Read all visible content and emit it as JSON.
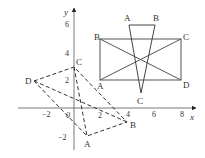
{
  "axes": {
    "x_label": "x",
    "y_label": "y",
    "origin_label": "0",
    "x_ticks": [
      {
        "value": -2,
        "label": "−2"
      },
      {
        "value": 2,
        "label": "2"
      },
      {
        "value": 4,
        "label": "4"
      },
      {
        "value": 6,
        "label": "6"
      },
      {
        "value": 8,
        "label": "8"
      }
    ],
    "y_ticks": [
      {
        "value": 6,
        "label": "6"
      },
      {
        "value": 4,
        "label": "4"
      },
      {
        "value": 2,
        "label": "2"
      },
      {
        "value": -2,
        "label": "−2"
      }
    ]
  },
  "left_quadrilateral": {
    "style": "dashed",
    "vertices": [
      {
        "label": "D",
        "x": -3,
        "y": 2
      },
      {
        "label": "C",
        "x": 0,
        "y": 3
      },
      {
        "label": "B",
        "x": 4,
        "y": -1
      },
      {
        "label": "A",
        "x": 1,
        "y": -2
      }
    ],
    "diagonals": [
      [
        "D",
        "B"
      ],
      [
        "C",
        "A"
      ]
    ]
  },
  "rectangle": {
    "style": "solid",
    "vertices": [
      {
        "label": "B",
        "x": 2,
        "y": 5
      },
      {
        "label": "C",
        "x": 8,
        "y": 5
      },
      {
        "label": "D",
        "x": 8,
        "y": 2
      },
      {
        "label": "A",
        "x": 2,
        "y": 2
      }
    ],
    "diagonals": [
      [
        "B",
        "D"
      ],
      [
        "A",
        "C"
      ]
    ]
  },
  "triangle": {
    "style": "solid",
    "vertices": [
      {
        "label": "A",
        "x": 4,
        "y": 6
      },
      {
        "label": "B",
        "x": 6,
        "y": 6
      },
      {
        "label": "C",
        "x": 5,
        "y": 1.5
      }
    ]
  }
}
